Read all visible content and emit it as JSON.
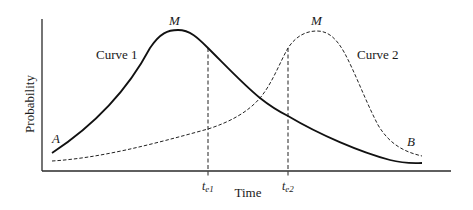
{
  "diagram": {
    "type": "probability-vs-time",
    "axes": {
      "xlabel": "Time",
      "ylabel": "Probability"
    },
    "curves": [
      {
        "name": "Curve 1",
        "style": "solid",
        "start_label": "A",
        "peak_label": "M"
      },
      {
        "name": "Curve 2",
        "style": "dashed",
        "end_label": "B",
        "peak_label": "M"
      }
    ],
    "markers": [
      {
        "label_main": "t",
        "label_sub": "e1"
      },
      {
        "label_main": "t",
        "label_sub": "e2"
      }
    ]
  }
}
